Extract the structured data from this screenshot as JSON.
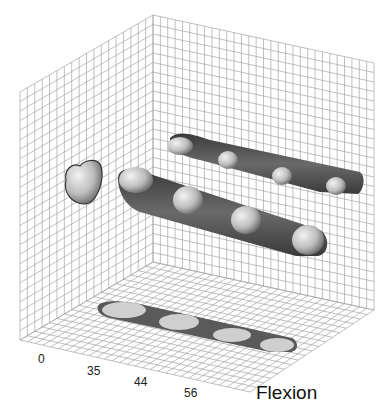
{
  "figure": {
    "axis_title": "Flexion",
    "tick_labels": [
      "0",
      "35",
      "44",
      "56"
    ],
    "colors": {
      "grid": "#9a9a9a",
      "band": "#4a4a4a",
      "bone": "#c8c8c8",
      "floor_band": "#6a6a6a"
    }
  },
  "chart_data": {
    "type": "3d-projection",
    "title": "",
    "xlabel": "Flexion",
    "categories": [
      "0",
      "35",
      "44",
      "56"
    ],
    "views": [
      {
        "name": "left-wall projection",
        "items": 1
      },
      {
        "name": "back-wall upper band",
        "items": 4
      },
      {
        "name": "3D trajectory band",
        "items": 4
      },
      {
        "name": "floor projection band",
        "items": 4
      }
    ],
    "grid": true
  }
}
